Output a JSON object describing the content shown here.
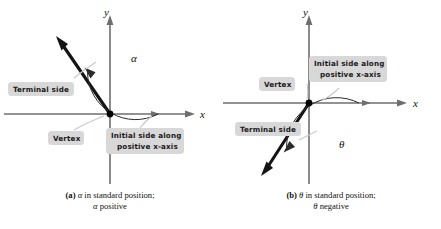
{
  "figure": {
    "type": "math-diagram",
    "topic": "Angles in standard position",
    "background_color": "#ffffff",
    "label_box_color": "#d8d8d8",
    "axis_color": "#6e6e6e",
    "ray_color": "#141414"
  },
  "panel_a": {
    "id": "a",
    "labels": {
      "y_axis": "y",
      "x_axis": "x",
      "angle_symbol": "α",
      "terminal_side": "Terminal side",
      "vertex": "Vertex",
      "initial_side_line1": "Initial side along",
      "initial_side_line2": "positive x-axis"
    },
    "caption": {
      "tag": "(a)",
      "line1_symbol": "α",
      "line1_rest": " in standard position;",
      "line2_symbol": "α",
      "line2_rest": " positive"
    },
    "geometry": {
      "vertex": [
        70,
        114
      ],
      "terminal_angle_deg": 118,
      "arc_sweep": "counterclockwise",
      "arc_from_deg": 0,
      "arc_to_deg": 118
    }
  },
  "panel_b": {
    "id": "b",
    "labels": {
      "y_axis": "y",
      "x_axis": "x",
      "angle_symbol": "θ",
      "terminal_side": "Terminal side",
      "vertex": "Vertex",
      "initial_side_line1": "Initial side along",
      "initial_side_line2": "positive x-axis"
    },
    "caption": {
      "tag": "(b)",
      "line1_symbol": "θ",
      "line1_rest": " in standard position;",
      "line2_symbol": "θ",
      "line2_rest": " negative"
    },
    "geometry": {
      "vertex": [
        76,
        103
      ],
      "terminal_angle_deg": -118,
      "arc_sweep": "clockwise",
      "arc_from_deg": 0,
      "arc_to_deg": -118
    }
  }
}
